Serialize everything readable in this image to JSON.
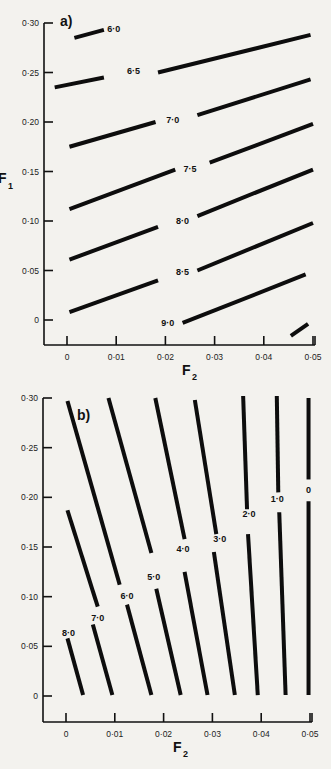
{
  "chart_data": [
    {
      "panel": "a)",
      "type": "line",
      "title": "",
      "xlabel": "F2",
      "ylabel": "F1",
      "xlim": [
        -0.005,
        0.05
      ],
      "ylim": [
        -0.025,
        0.3
      ],
      "xticks": [
        0,
        0.01,
        0.02,
        0.03,
        0.04,
        0.05
      ],
      "xtick_labels": [
        "0",
        "0·01",
        "0·02",
        "0·03",
        "0·04",
        "0·05"
      ],
      "yticks": [
        0,
        0.05,
        0.1,
        0.15,
        0.2,
        0.25,
        0.3
      ],
      "ytick_labels": [
        "0",
        "0·05",
        "0·10",
        "0·15",
        "0·20",
        "0·25",
        "0·30"
      ],
      "grid": false,
      "description": "Contour lines of constant value (labelled) in F2–F1 space",
      "series": [
        {
          "name": "6·0",
          "label_at": [
            0.0095,
            0.294
          ],
          "segments": [
            [
              [
                0.0015,
                0.285
              ],
              [
                0.0075,
                0.293
              ]
            ]
          ]
        },
        {
          "name": "6·5",
          "label_at": [
            0.0135,
            0.252
          ],
          "segments": [
            [
              [
                -0.0025,
                0.235
              ],
              [
                0.0075,
                0.245
              ]
            ],
            [
              [
                0.0185,
                0.25
              ],
              [
                0.0495,
                0.288
              ]
            ]
          ]
        },
        {
          "name": "7·0",
          "label_at": [
            0.0215,
            0.202
          ],
          "segments": [
            [
              [
                0.0005,
                0.175
              ],
              [
                0.018,
                0.2
              ]
            ],
            [
              [
                0.0265,
                0.207
              ],
              [
                0.0495,
                0.243
              ]
            ]
          ]
        },
        {
          "name": "7·5",
          "label_at": [
            0.025,
            0.153
          ],
          "segments": [
            [
              [
                0.0005,
                0.112
              ],
              [
                0.022,
                0.152
              ]
            ],
            [
              [
                0.029,
                0.159
              ],
              [
                0.05,
                0.198
              ]
            ]
          ]
        },
        {
          "name": "8·0",
          "label_at": [
            0.0235,
            0.1
          ],
          "segments": [
            [
              [
                0.0005,
                0.061
              ],
              [
                0.0185,
                0.094
              ]
            ],
            [
              [
                0.0265,
                0.105
              ],
              [
                0.05,
                0.152
              ]
            ]
          ]
        },
        {
          "name": "8·5",
          "label_at": [
            0.0235,
            0.048
          ],
          "segments": [
            [
              [
                0.0005,
                0.008
              ],
              [
                0.0185,
                0.04
              ]
            ],
            [
              [
                0.0265,
                0.05
              ],
              [
                0.05,
                0.098
              ]
            ]
          ]
        },
        {
          "name": "9·0",
          "label_at": [
            0.0205,
            -0.003
          ],
          "segments": [
            [
              [
                0.0235,
                -0.003
              ],
              [
                0.0485,
                0.046
              ]
            ]
          ]
        },
        {
          "name": "",
          "label_at": null,
          "segments": [
            [
              [
                0.0455,
                -0.016
              ],
              [
                0.049,
                -0.004
              ]
            ]
          ]
        }
      ]
    },
    {
      "panel": "b)",
      "type": "line",
      "title": "",
      "xlabel": "F2",
      "ylabel": "",
      "xlim": [
        -0.005,
        0.05
      ],
      "ylim": [
        -0.025,
        0.3
      ],
      "xticks": [
        0,
        0.01,
        0.02,
        0.03,
        0.04,
        0.05
      ],
      "xtick_labels": [
        "0",
        "0·01",
        "0·02",
        "0·03",
        "0·04",
        "0·05"
      ],
      "yticks": [
        0,
        0.05,
        0.1,
        0.15,
        0.2,
        0.25,
        0.3
      ],
      "ytick_labels": [
        "0",
        "0·05",
        "0·10",
        "0·15",
        "0·20",
        "0·25",
        "0·30"
      ],
      "grid": false,
      "description": "Contour lines of constant value (labelled) in F2–F1 space",
      "series": [
        {
          "name": "8·0",
          "label_at": [
            0.0005,
            0.063
          ],
          "segments": [
            [
              [
                0.0003,
                0.058
              ],
              [
                0.0035,
                0.001
              ]
            ]
          ]
        },
        {
          "name": "7·0",
          "label_at": [
            0.0065,
            0.079
          ],
          "segments": [
            [
              [
                0.0003,
                0.187
              ],
              [
                0.0065,
                0.09
              ]
            ],
            [
              [
                0.0055,
                0.072
              ],
              [
                0.0095,
                0.001
              ]
            ]
          ]
        },
        {
          "name": "6·0",
          "label_at": [
            0.0125,
            0.101
          ],
          "segments": [
            [
              [
                0.0003,
                0.297
              ],
              [
                0.011,
                0.112
              ]
            ],
            [
              [
                0.0125,
                0.092
              ],
              [
                0.0175,
                0.001
              ]
            ]
          ]
        },
        {
          "name": "5·0",
          "label_at": [
            0.018,
            0.12
          ],
          "segments": [
            [
              [
                0.0087,
                0.3
              ],
              [
                0.0175,
                0.144
              ]
            ],
            [
              [
                0.0185,
                0.108
              ],
              [
                0.0235,
                0.001
              ]
            ]
          ]
        },
        {
          "name": "4·0",
          "label_at": [
            0.024,
            0.148
          ],
          "segments": [
            [
              [
                0.0183,
                0.3
              ],
              [
                0.0243,
                0.158
              ]
            ],
            [
              [
                0.0243,
                0.125
              ],
              [
                0.029,
                0.001
              ]
            ]
          ]
        },
        {
          "name": "3·0",
          "label_at": [
            0.0315,
            0.158
          ],
          "segments": [
            [
              [
                0.0264,
                0.298
              ],
              [
                0.0308,
                0.163
              ]
            ],
            [
              [
                0.0303,
                0.145
              ],
              [
                0.0346,
                0.001
              ]
            ]
          ]
        },
        {
          "name": "2·0",
          "label_at": [
            0.0375,
            0.183
          ],
          "segments": [
            [
              [
                0.0363,
                0.302
              ],
              [
                0.0371,
                0.188
              ]
            ],
            [
              [
                0.0373,
                0.163
              ],
              [
                0.0393,
                0.001
              ]
            ]
          ]
        },
        {
          "name": "1·0",
          "label_at": [
            0.0433,
            0.198
          ],
          "segments": [
            [
              [
                0.0432,
                0.302
              ],
              [
                0.0435,
                0.205
              ]
            ],
            [
              [
                0.0437,
                0.185
              ],
              [
                0.045,
                0.001
              ]
            ]
          ]
        },
        {
          "name": "0",
          "label_at": [
            0.0497,
            0.207
          ],
          "segments": [
            [
              [
                0.0497,
                0.3
              ],
              [
                0.0497,
                0.218
              ]
            ],
            [
              [
                0.0497,
                0.196
              ],
              [
                0.0497,
                0.001
              ]
            ]
          ]
        }
      ]
    }
  ],
  "figure": {
    "panels": [
      {
        "label": "a)",
        "xlabel_main": "F",
        "xlabel_sub": "2",
        "ylabel_main": "F",
        "ylabel_sub": "1"
      },
      {
        "label": "b)",
        "xlabel_main": "F",
        "xlabel_sub": "2",
        "ylabel_main": "",
        "ylabel_sub": ""
      }
    ]
  }
}
